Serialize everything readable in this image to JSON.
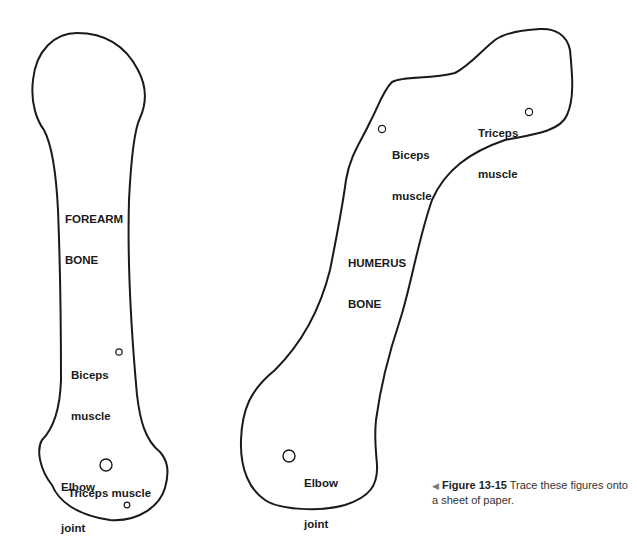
{
  "figure": {
    "number": "Figure 13-15",
    "caption": "Trace these figures onto a sheet of paper.",
    "pointer_glyph": "◀"
  },
  "forearm": {
    "title_line1": "FOREARM",
    "title_line2": "BONE",
    "biceps_line1": "Biceps",
    "biceps_line2": "muscle",
    "elbow_line1": "Elbow",
    "elbow_line2": "joint",
    "triceps": "Triceps muscle"
  },
  "humerus": {
    "title_line1": "HUMERUS",
    "title_line2": "BONE",
    "biceps_line1": "Biceps",
    "biceps_line2": "muscle",
    "triceps_line1": "Triceps",
    "triceps_line2": "muscle",
    "elbow_line1": "Elbow",
    "elbow_line2": "joint"
  },
  "colors": {
    "outline": "#1a1a1a",
    "background": "#ffffff"
  }
}
